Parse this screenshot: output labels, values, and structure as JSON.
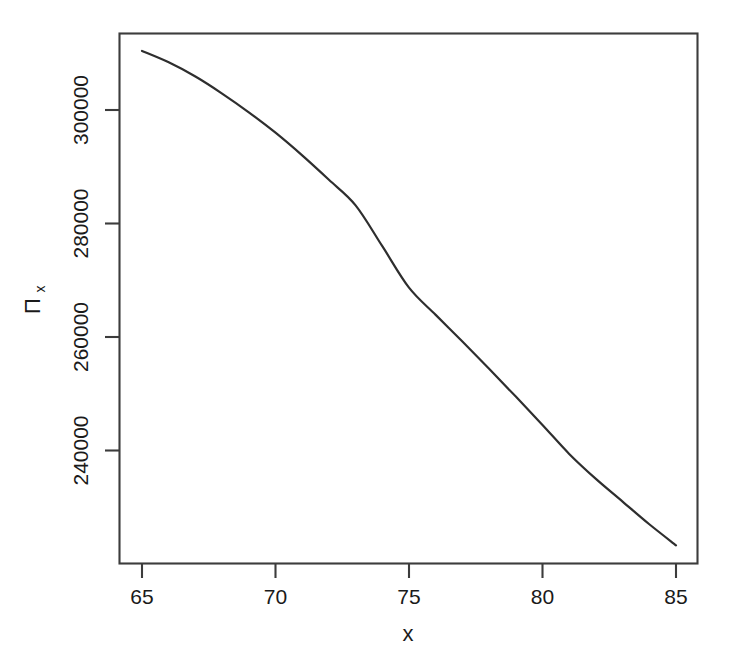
{
  "chart_data": {
    "type": "line",
    "title": "",
    "subtitle": "",
    "xlabel": "x",
    "ylabel": "Π",
    "ylabel_subscript": "x",
    "ylabel_full": "Πx",
    "xlim": [
      64.2,
      85.9
    ],
    "ylim": [
      222000,
      312500
    ],
    "xticks": [
      65,
      70,
      75,
      80,
      85
    ],
    "xtick_labels": [
      "65",
      "70",
      "75",
      "80",
      "85"
    ],
    "yticks": [
      240000,
      260000,
      280000,
      300000
    ],
    "ytick_labels": [
      "240000",
      "260000",
      "280000",
      "300000"
    ],
    "grid": false,
    "legend": null,
    "legend_position": "none",
    "frame": "box",
    "line_color": "#2e2e2e",
    "background_color": "#ffffff",
    "axis_color": "#3c3c3c",
    "series": [
      {
        "name": "Pi_x",
        "x": [
          65,
          66,
          67,
          68,
          69,
          70,
          71,
          72,
          73,
          74,
          75,
          76,
          77,
          78,
          79,
          80,
          81,
          82,
          83,
          84,
          85
        ],
        "values": [
          310400,
          308400,
          305900,
          302900,
          299600,
          296000,
          292000,
          287700,
          283200,
          276000,
          268700,
          263900,
          259200,
          254400,
          249500,
          244500,
          239400,
          235000,
          231000,
          227000,
          223300
        ]
      }
    ],
    "annotations": []
  }
}
